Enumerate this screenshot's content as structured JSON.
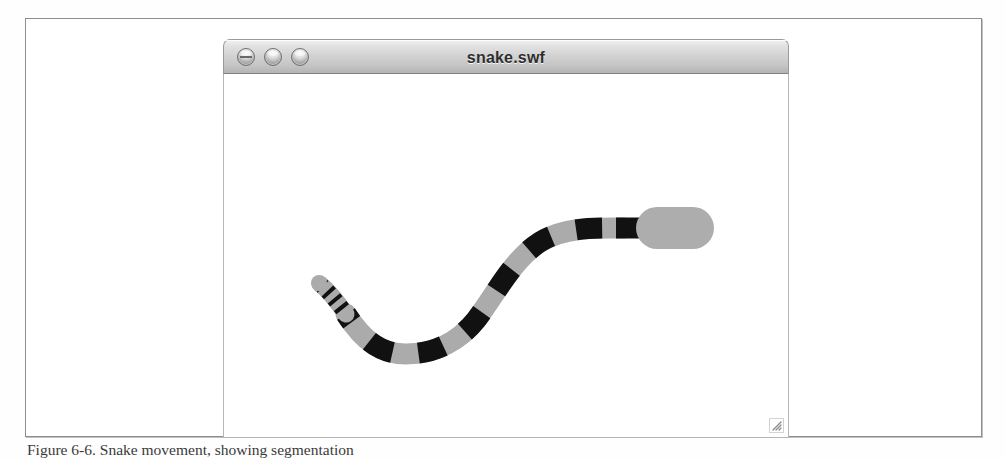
{
  "figure": {
    "caption": "Figure 6-6. Snake movement, showing segmentation"
  },
  "window": {
    "title": "snake.swf",
    "controls": [
      {
        "name": "close",
        "label": "Close"
      },
      {
        "name": "minimize",
        "label": "Minimize"
      },
      {
        "name": "zoom",
        "label": "Zoom"
      }
    ],
    "resize_grip_label": "Resize"
  },
  "stage": {
    "background_color": "#ffffff",
    "body_gray": "#ababab",
    "band_black": "#111111",
    "head_gray": "#adadad",
    "description": "Segmented snake drawn as an S-curve with alternating gray and black bands, a capsule-shaped head at upper right and a thin tapering tail at lower left.",
    "head": {
      "x": 641,
      "y": 163,
      "width": 48,
      "height": 36,
      "shape": "capsule"
    },
    "tail": {
      "x": 335,
      "y": 262,
      "shape": "tapered-rings",
      "ring_count": 4
    },
    "segment_count": 14
  }
}
